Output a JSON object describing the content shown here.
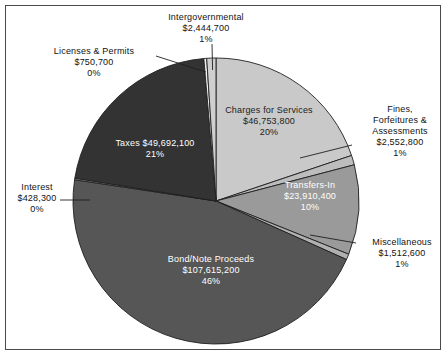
{
  "chart_data": {
    "type": "pie",
    "title": "",
    "subtitle": "",
    "xlabel": "",
    "ylabel": "",
    "legend_position": "none",
    "grid": false,
    "value_prefix": "$",
    "total_value": 235907800,
    "categories": [
      "Charges for Services",
      "Fines, Forfeitures & Assessments",
      "Transfers-In",
      "Miscellaneous",
      "Bond/Note Proceeds",
      "Interest",
      "Taxes",
      "Licenses & Permits",
      "Intergovernmental"
    ],
    "values": [
      46753800,
      2552800,
      23910400,
      1512600,
      107615200,
      428300,
      49692100,
      750700,
      2444700
    ],
    "percents": [
      20,
      1,
      10,
      1,
      46,
      0,
      21,
      0,
      1
    ],
    "slices": [
      {
        "label": "Charges for Services",
        "value_text": "$46,753,800",
        "percent_text": "20%",
        "value": 46753800,
        "percent": 20,
        "color": "#c9c9c9",
        "label_placement": "inside"
      },
      {
        "label": "Fines, Forfeitures & Assessments",
        "value_text": "$2,552,800",
        "percent_text": "1%",
        "value": 2552800,
        "percent": 1,
        "color": "#bdbdbd",
        "label_placement": "outside"
      },
      {
        "label": "Transfers-In",
        "value_text": "$23,910,400",
        "percent_text": "10%",
        "value": 23910400,
        "percent": 10,
        "color": "#9a9a9a",
        "label_placement": "inside"
      },
      {
        "label": "Miscellaneous",
        "value_text": "$1,512,600",
        "percent_text": "1%",
        "value": 1512600,
        "percent": 1,
        "color": "#b0b0b0",
        "label_placement": "outside"
      },
      {
        "label": "Bond/Note Proceeds",
        "value_text": "$107,615,200",
        "percent_text": "46%",
        "value": 107615200,
        "percent": 46,
        "color": "#565656",
        "label_placement": "inside"
      },
      {
        "label": "Interest",
        "value_text": "$428,300",
        "percent_text": "0%",
        "value": 428300,
        "percent": 0,
        "color": "#8a8a8a",
        "label_placement": "outside"
      },
      {
        "label": "Taxes",
        "value_text": "$49,692,100",
        "percent_text": "21%",
        "value": 49692100,
        "percent": 21,
        "color": "#333333",
        "label_placement": "inside"
      },
      {
        "label": "Licenses & Permits",
        "value_text": "$750,700",
        "percent_text": "0%",
        "value": 750700,
        "percent": 0,
        "color": "#f2f2f2",
        "label_placement": "outside"
      },
      {
        "label": "Intergovernmental",
        "value_text": "$2,444,700",
        "percent_text": "1%",
        "value": 2444700,
        "percent": 1,
        "color": "#cfcfcf",
        "label_placement": "outside"
      }
    ]
  },
  "labels": {
    "intergovernmental": {
      "name": "Intergovernmental",
      "value": "$2,444,700",
      "percent": "1%"
    },
    "licenses": {
      "name": "Licenses & Permits",
      "value": "$750,700",
      "percent": "0%"
    },
    "charges": {
      "name": "Charges for Services",
      "value": "$46,753,800",
      "percent": "20%"
    },
    "fines": {
      "line1": "Fines,",
      "line2": "Forfeitures &",
      "line3": "Assessments",
      "value": "$2,552,800",
      "percent": "1%"
    },
    "transfers": {
      "name": "Transfers-In",
      "value": "$23,910,400",
      "percent": "10%"
    },
    "miscellaneous": {
      "name": "Miscellaneous",
      "value": "$1,512,600",
      "percent": "1%"
    },
    "bond": {
      "name": "Bond/Note Proceeds",
      "value": "$107,615,200",
      "percent": "46%"
    },
    "taxes": {
      "name_with_value": "Taxes $49,692,100",
      "percent": "21%"
    },
    "interest": {
      "name": "Interest",
      "value": "$428,300",
      "percent": "0%"
    }
  }
}
